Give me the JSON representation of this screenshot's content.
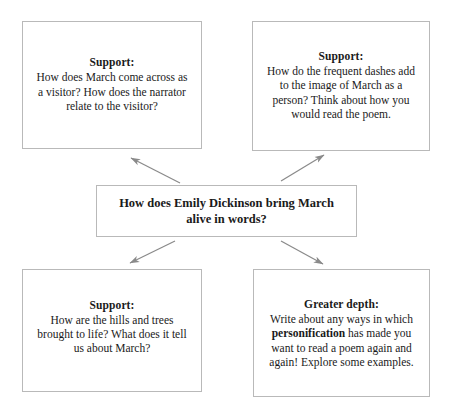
{
  "diagram": {
    "type": "concept-map",
    "central_question": "How does Emily Dickinson bring March alive in words?",
    "border_color": "#b9b9b9",
    "arrow_color": "#8a8a8a",
    "text_color": "#1a1a1a",
    "background_color": "#ffffff"
  },
  "nodes": {
    "top_left": {
      "heading": "Support:",
      "body": "How does March come across as a visitor? How does the narrator relate to the visitor?"
    },
    "top_right": {
      "heading": "Support:",
      "body": "How do the frequent dashes add to the image of March as a person? Think about how you would read the poem."
    },
    "center": {
      "text": "How does Emily Dickinson bring March alive in words?"
    },
    "bottom_left": {
      "heading": "Support:",
      "body": "How are the hills and trees brought to life? What does it tell us about March?"
    },
    "bottom_right": {
      "heading": "Greater depth:",
      "body_before": "Write about any ways in which ",
      "body_emphasis": "personification",
      "body_after": " has made you want to read a poem again and again! Explore some examples."
    }
  },
  "arrows": [
    {
      "name": "arrow-center-to-top-left",
      "direction": "up-left"
    },
    {
      "name": "arrow-center-to-top-right",
      "direction": "up-right"
    },
    {
      "name": "arrow-center-to-bottom-left",
      "direction": "down-left"
    },
    {
      "name": "arrow-center-to-bottom-right",
      "direction": "down-right"
    }
  ]
}
